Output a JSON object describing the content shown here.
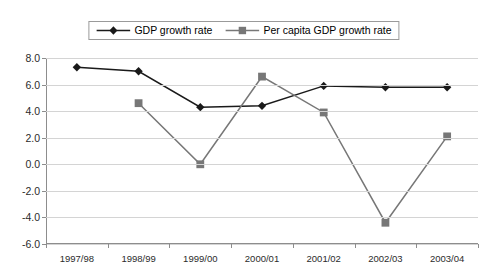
{
  "chart_data": {
    "type": "line",
    "title": "",
    "xlabel": "",
    "ylabel": "",
    "categories": [
      "1997/98",
      "1998/99",
      "1999/00",
      "2000/01",
      "2001/02",
      "2002/03",
      "2003/04"
    ],
    "ylim": [
      -6.0,
      8.0
    ],
    "ytick_step": 2.0,
    "ytick_labels": [
      "8.0",
      "6.0",
      "4.0",
      "2.0",
      "0.0",
      "-2.0",
      "-4.0",
      "-6.0"
    ],
    "ytick_values": [
      8.0,
      6.0,
      4.0,
      2.0,
      0.0,
      -2.0,
      -4.0,
      -6.0
    ],
    "grid": true,
    "legend_position": "top-center",
    "series": [
      {
        "name": "GDP growth rate",
        "marker": "diamond",
        "color": "#1a1a1a",
        "values": [
          7.3,
          7.0,
          4.3,
          4.4,
          5.9,
          5.8,
          5.8
        ]
      },
      {
        "name": "Per capita GDP growth rate",
        "marker": "square",
        "color": "#777777",
        "values": [
          null,
          4.6,
          0.0,
          6.6,
          3.9,
          -4.4,
          2.1
        ]
      }
    ]
  },
  "legend": {
    "entries": [
      {
        "label": "GDP growth rate",
        "marker_name": "diamond-marker"
      },
      {
        "label": "Per capita GDP growth rate",
        "marker_name": "square-marker"
      }
    ]
  },
  "colors": {
    "series_gdp": "#1a1a1a",
    "series_per_capita": "#777777",
    "gridline": "#d4d4d4",
    "axis": "#8d8d8d",
    "background": "#ffffff",
    "text": "#2b2b2b"
  }
}
